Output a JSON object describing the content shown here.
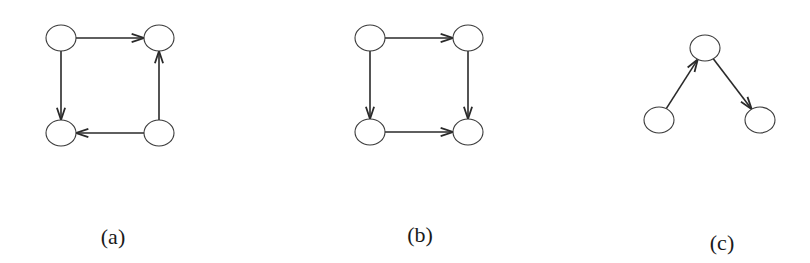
{
  "figure": {
    "panels": [
      {
        "id": "a",
        "caption": "(a)",
        "caption_pos": {
          "x": 113,
          "y": 224
        },
        "nodes": [
          {
            "id": "a-tl",
            "cx": 61,
            "cy": 38
          },
          {
            "id": "a-tr",
            "cx": 159,
            "cy": 38
          },
          {
            "id": "a-bl",
            "cx": 61,
            "cy": 133
          },
          {
            "id": "a-br",
            "cx": 159,
            "cy": 133
          }
        ],
        "edges": [
          {
            "from": "a-tl",
            "to": "a-tr"
          },
          {
            "from": "a-tl",
            "to": "a-bl"
          },
          {
            "from": "a-br",
            "to": "a-bl"
          },
          {
            "from": "a-br",
            "to": "a-tr"
          }
        ]
      },
      {
        "id": "b",
        "caption": "(b)",
        "caption_pos": {
          "x": 420,
          "y": 222
        },
        "nodes": [
          {
            "id": "b-tl",
            "cx": 370,
            "cy": 38
          },
          {
            "id": "b-tr",
            "cx": 468,
            "cy": 38
          },
          {
            "id": "b-bl",
            "cx": 370,
            "cy": 132
          },
          {
            "id": "b-br",
            "cx": 468,
            "cy": 132
          }
        ],
        "edges": [
          {
            "from": "b-tl",
            "to": "b-tr"
          },
          {
            "from": "b-tl",
            "to": "b-bl"
          },
          {
            "from": "b-tr",
            "to": "b-br"
          },
          {
            "from": "b-bl",
            "to": "b-br"
          }
        ]
      },
      {
        "id": "c",
        "caption": "(c)",
        "caption_pos": {
          "x": 722,
          "y": 230
        },
        "nodes": [
          {
            "id": "c-top",
            "cx": 705,
            "cy": 48
          },
          {
            "id": "c-bl",
            "cx": 659,
            "cy": 120
          },
          {
            "id": "c-br",
            "cx": 760,
            "cy": 120
          }
        ],
        "edges": [
          {
            "from": "c-bl",
            "to": "c-top"
          },
          {
            "from": "c-top",
            "to": "c-br"
          }
        ]
      }
    ],
    "style": {
      "node_rx": 15,
      "node_ry": 13,
      "stroke": "#3a3a3a",
      "edge_stroke": "#2a2a2a",
      "fill": "#ffffff"
    }
  }
}
